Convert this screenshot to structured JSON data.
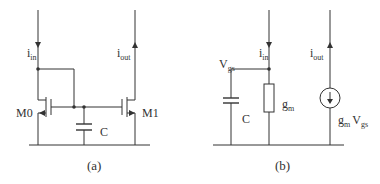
{
  "diagram_a": {
    "caption": "(a)",
    "current_in": {
      "main": "i",
      "sub": "in"
    },
    "current_out": {
      "main": "i",
      "sub": "out"
    },
    "transistor_left": "M0",
    "transistor_right": "M1",
    "capacitor": "C"
  },
  "diagram_b": {
    "caption": "(b)",
    "current_in": {
      "main": "i",
      "sub": "in"
    },
    "current_out": {
      "main": "i",
      "sub": "out"
    },
    "node_voltage": {
      "main": "V",
      "sub": "gs"
    },
    "capacitor": "C",
    "resistor": {
      "main": "g",
      "sub": "m"
    },
    "source": {
      "g": "g",
      "g_sub": "m",
      "v": "V",
      "v_sub": "gs"
    }
  },
  "colors": {
    "wire": "#333333",
    "background": "#ffffff"
  }
}
